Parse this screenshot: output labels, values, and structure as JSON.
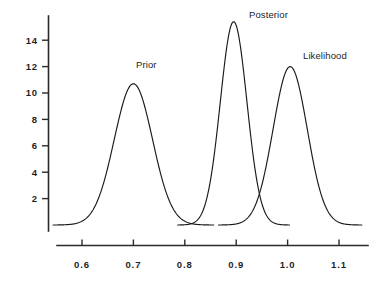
{
  "chart_data": {
    "type": "line",
    "title": "",
    "subtitle": "",
    "xlabel": "",
    "ylabel": "",
    "xlim": [
      0.55,
      1.15
    ],
    "ylim": [
      0,
      16
    ],
    "grid": false,
    "legend_position": "inline-annotations",
    "x_ticks": [
      "0.6",
      "0.7",
      "0.8",
      "0.9",
      "1.0",
      "1.1"
    ],
    "x_tick_values": [
      0.6,
      0.7,
      0.8,
      0.9,
      1.0,
      1.1
    ],
    "y_ticks": [
      "2",
      "4",
      "6",
      "8",
      "10",
      "12",
      "14"
    ],
    "y_tick_values": [
      2,
      4,
      6,
      8,
      10,
      12,
      14
    ],
    "annotations": [
      {
        "text": "Prior",
        "x": 0.705,
        "y": 11.9
      },
      {
        "text": "Posterior",
        "x": 0.925,
        "y": 15.7
      },
      {
        "text": "Likelihood",
        "x": 1.03,
        "y": 12.6
      }
    ],
    "series": [
      {
        "name": "Prior",
        "distribution": "normal",
        "mean": 0.7,
        "sigma": 0.0372,
        "peak": 10.7,
        "color": "#1a1a1a"
      },
      {
        "name": "Posterior",
        "distribution": "normal",
        "mean": 0.895,
        "sigma": 0.0259,
        "peak": 15.4,
        "color": "#1a1a1a"
      },
      {
        "name": "Likelihood",
        "distribution": "normal",
        "mean": 1.005,
        "sigma": 0.0332,
        "peak": 12.0,
        "color": "#1a1a1a"
      }
    ]
  },
  "figure": {
    "background_color": "#ffffff",
    "axis_color": "#2b2b2b",
    "curve_color": "#1a1a1a",
    "label_color": "#242424"
  }
}
